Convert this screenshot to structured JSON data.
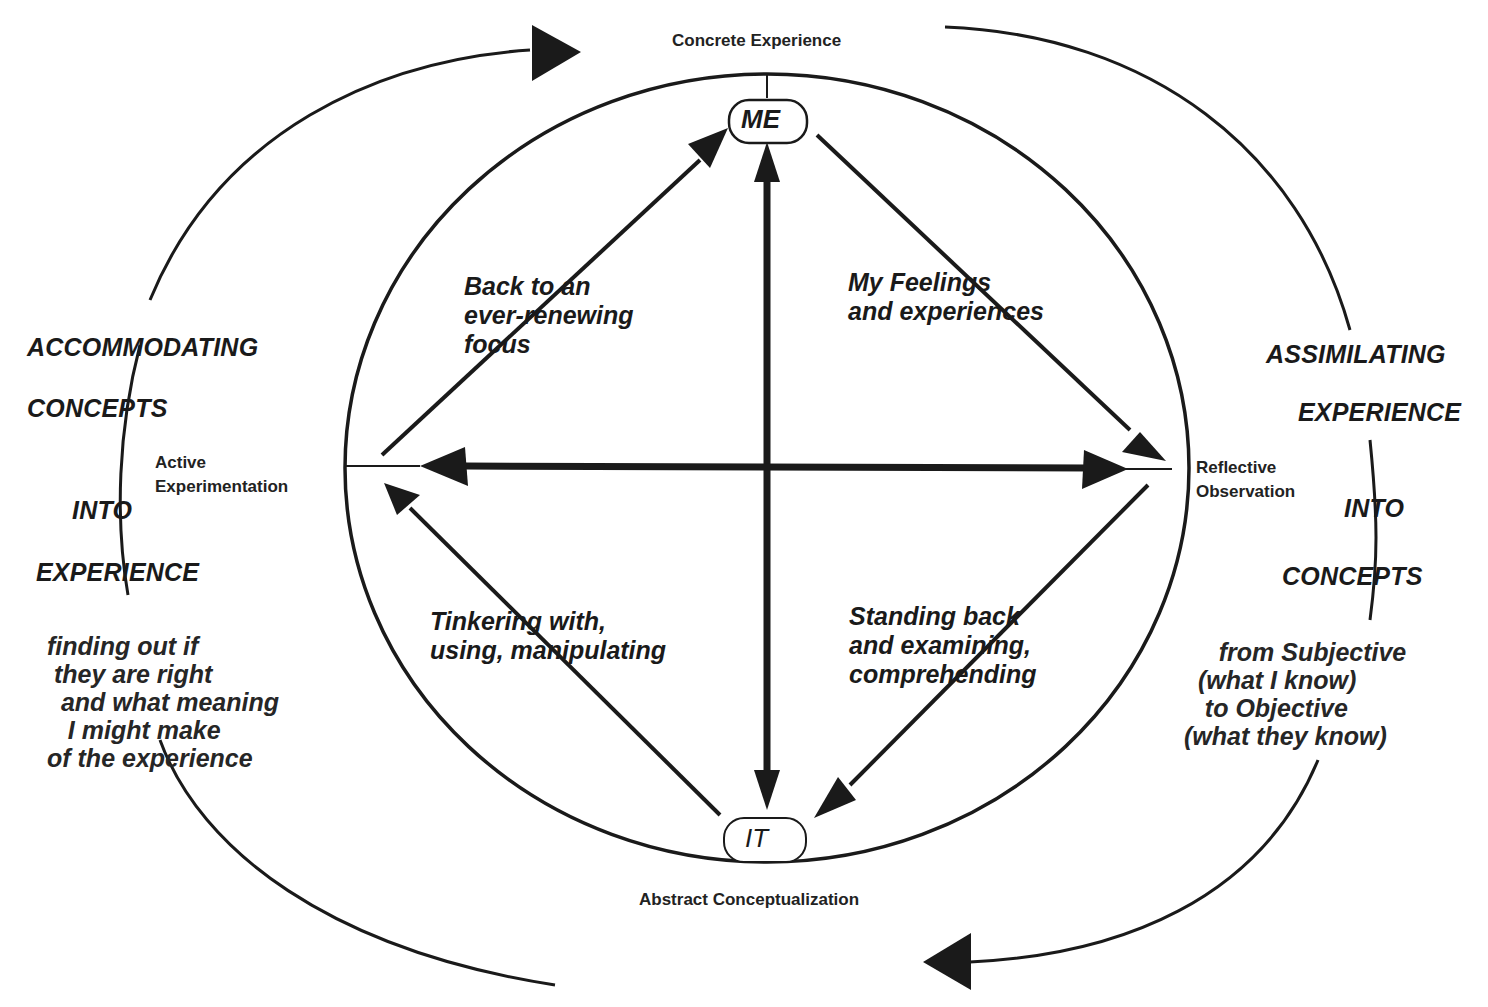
{
  "diagram": {
    "poles": {
      "top": "Concrete Experience",
      "bottom": "Abstract Conceptualization",
      "left": "Active\nExperimentation",
      "right": "Reflective\nObservation"
    },
    "nodes": {
      "top": "ME",
      "bottom": "IT"
    },
    "quadrant_captions": {
      "upper_left": "Back to an\never-renewing\nfocus",
      "upper_right": "My Feelings\nand experiences",
      "lower_left": "Tinkering with,\nusing, manipulating",
      "lower_right": "Standing back\nand examining,\ncomprehending"
    },
    "left_cycle": {
      "words": [
        "ACCOMMODATING",
        "CONCEPTS",
        "INTO",
        "EXPERIENCE"
      ],
      "note": "finding out if\n they are right\n  and what meaning\n   I might make\nof the experience"
    },
    "right_cycle": {
      "words": [
        "ASSIMILATING",
        "EXPERIENCE",
        "INTO",
        "CONCEPTS"
      ],
      "note": "     from Subjective\n  (what I know)\n   to Objective\n(what they know)"
    },
    "colors": {
      "ink": "#1a1a1a",
      "background": "#ffffff"
    }
  }
}
